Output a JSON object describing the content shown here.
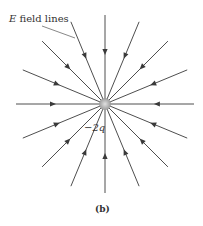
{
  "diagram": {
    "title_label": "E field lines",
    "title_italic": "E",
    "title_rest": " field lines",
    "charge_label": "−2q",
    "caption": "(b)",
    "center": [
      105,
      104
    ],
    "radius": 89,
    "line_count": 16,
    "line_color": "#3a3a3a",
    "charge_color": "#a8a8a8"
  }
}
